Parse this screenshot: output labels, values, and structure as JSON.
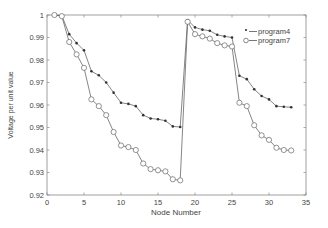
{
  "chart_data": {
    "type": "line",
    "title": "",
    "xlabel": "Node Number",
    "ylabel": "Voltage per unit value",
    "xlim": [
      0,
      35
    ],
    "ylim": [
      0.92,
      1.0
    ],
    "xticks": [
      0,
      5,
      10,
      15,
      20,
      25,
      30,
      35
    ],
    "yticks": [
      0.92,
      0.93,
      0.94,
      0.95,
      0.96,
      0.97,
      0.98,
      0.99,
      1
    ],
    "ytick_labels": [
      "0.92",
      "0.93",
      "0.94",
      "0.95",
      "0.96",
      "0.97",
      "0.98",
      "0.99",
      "1"
    ],
    "grid": false,
    "legend_position": "upper right",
    "x": [
      1,
      2,
      3,
      4,
      5,
      6,
      7,
      8,
      9,
      10,
      11,
      12,
      13,
      14,
      15,
      16,
      17,
      18,
      19,
      20,
      21,
      22,
      23,
      24,
      25,
      26,
      27,
      28,
      29,
      30,
      31,
      32,
      33
    ],
    "series": [
      {
        "name": "program4",
        "marker": "*",
        "legend_label": "*—program4",
        "values": [
          1.0,
          0.9997,
          0.9915,
          0.9875,
          0.9843,
          0.975,
          0.9732,
          0.97,
          0.9655,
          0.961,
          0.9605,
          0.9595,
          0.9555,
          0.954,
          0.9537,
          0.953,
          0.9505,
          0.9502,
          0.9977,
          0.9945,
          0.9935,
          0.993,
          0.9912,
          0.9905,
          0.99,
          0.973,
          0.9715,
          0.967,
          0.964,
          0.9625,
          0.9595,
          0.9592,
          0.959
        ]
      },
      {
        "name": "program7",
        "marker": "o",
        "legend_label": "o—program7",
        "values": [
          1.0,
          0.9995,
          0.988,
          0.9825,
          0.9765,
          0.9625,
          0.9595,
          0.9555,
          0.948,
          0.942,
          0.9413,
          0.94,
          0.934,
          0.9315,
          0.931,
          0.9305,
          0.927,
          0.9265,
          0.997,
          0.9915,
          0.9905,
          0.9895,
          0.9875,
          0.9865,
          0.986,
          0.961,
          0.9595,
          0.951,
          0.9465,
          0.9445,
          0.941,
          0.94,
          0.9398
        ]
      }
    ]
  },
  "legend": {
    "items": [
      {
        "symbol": "*",
        "label": "program4"
      },
      {
        "symbol": "o",
        "label": "program7"
      }
    ]
  }
}
